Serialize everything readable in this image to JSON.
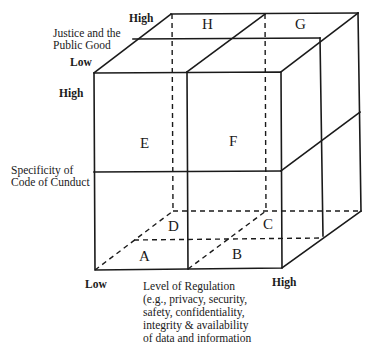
{
  "diagram": {
    "type": "3d-cube-matrix",
    "axes": {
      "z_depth": {
        "label": "Justice and the\nPublic Good",
        "low": "Low",
        "high": "High"
      },
      "y_vertical": {
        "label": "Specificity of\nCode of Cunduct",
        "high": "High"
      },
      "x_horizontal": {
        "label": "Level of Regulation\n(e.g., privacy, security,\nsafety, confidentiality,\nintegrity & availability\nof data and information",
        "low": "Low",
        "high": "High"
      }
    },
    "cells": {
      "A": "A",
      "B": "B",
      "C": "C",
      "D": "D",
      "E": "E",
      "F": "F",
      "G": "G",
      "H": "H"
    },
    "line_color": "#1a1a1a"
  }
}
